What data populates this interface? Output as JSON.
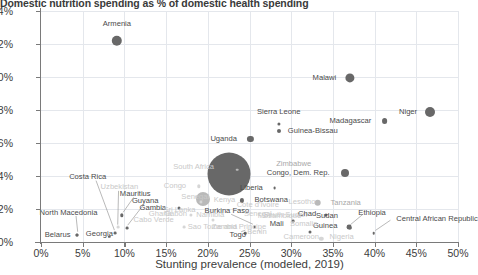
{
  "chart_data": {
    "type": "scatter",
    "title": "Domestic nutrition spending as % of domestic health spending",
    "xlabel": "Stunting prevalence (modeled, 2019)",
    "ylabel": "",
    "xlim": [
      0,
      50
    ],
    "ylim": [
      0,
      14
    ],
    "xticks": [
      "0%",
      "5%",
      "10%",
      "15%",
      "20%",
      "25%",
      "30%",
      "35%",
      "40%",
      "45%",
      "50%"
    ],
    "yticks": [
      "0%",
      "2%",
      "4%",
      "6%",
      "8%",
      "10%",
      "12%",
      "14%"
    ],
    "grid": true,
    "legend": "none",
    "size_encoding": "bubble area",
    "colors": {
      "bubble_dark": "#686868",
      "bubble_mid": "#b9b9b9",
      "bubble_faint": "#d6d6d6",
      "grid": "#e4e7ec",
      "axis": "#7a7a7a",
      "text": "#3c3c3c"
    },
    "points": [
      {
        "name": "Armenia",
        "x": 9.1,
        "y": 12.2,
        "r": 5.2,
        "tone": "dark",
        "lx": 9.1,
        "ly": 13.2,
        "anchor": "c"
      },
      {
        "name": "Malawi",
        "x": 37.0,
        "y": 9.95,
        "r": 4.6,
        "tone": "dark",
        "lx": 35.4,
        "ly": 9.95,
        "anchor": "r"
      },
      {
        "name": "Niger",
        "x": 46.7,
        "y": 7.85,
        "r": 5.0,
        "tone": "dark",
        "lx": 45.1,
        "ly": 7.85,
        "anchor": "r"
      },
      {
        "name": "Madagascar",
        "x": 41.2,
        "y": 7.35,
        "r": 2.9,
        "tone": "dark",
        "lx": 39.6,
        "ly": 7.35,
        "anchor": "r"
      },
      {
        "name": "Sierra Leone",
        "x": 28.5,
        "y": 7.15,
        "r": 1.6,
        "tone": "dark",
        "lx": 28.5,
        "ly": 7.9,
        "anchor": "c"
      },
      {
        "name": "Guinea-Bissau",
        "x": 28.5,
        "y": 6.72,
        "r": 2.0,
        "tone": "dark",
        "lx": 29.6,
        "ly": 6.72,
        "anchor": "l"
      },
      {
        "name": "Uganda",
        "x": 25.1,
        "y": 6.25,
        "r": 3.1,
        "tone": "dark",
        "lx": 23.5,
        "ly": 6.25,
        "anchor": "r"
      },
      {
        "name": "Zimbabwe",
        "x": 23.5,
        "y": 4.38,
        "r": 1.3,
        "tone": "mid",
        "lx": 28.2,
        "ly": 4.72,
        "anchor": "l"
      },
      {
        "name": "Congo, Dem. Rep.",
        "x": 36.4,
        "y": 4.18,
        "r": 4.0,
        "tone": "dark",
        "lx": 34.6,
        "ly": 4.18,
        "anchor": "r"
      },
      {
        "name": "South Africa",
        "x": 18.3,
        "y": 4.52,
        "r": 0.0,
        "tone": "faint",
        "lx": 18.3,
        "ly": 4.52,
        "anchor": "c"
      },
      {
        "name": "big-bubble",
        "x": 22.6,
        "y": 4.15,
        "r": 21.5,
        "tone": "dark",
        "lx": null,
        "ly": null,
        "anchor": "c"
      },
      {
        "name": "mid-bubble",
        "x": 19.4,
        "y": 2.62,
        "r": 7.0,
        "tone": "mid",
        "lx": null,
        "ly": null,
        "anchor": "c"
      },
      {
        "name": "Liberia",
        "x": 28.0,
        "y": 3.25,
        "r": 1.4,
        "tone": "dark",
        "lx": 26.6,
        "ly": 3.25,
        "anchor": "r"
      },
      {
        "name": "Costa Rica",
        "x": 8.9,
        "y": 0.52,
        "r": 1.4,
        "tone": "dark",
        "lx": 5.6,
        "ly": 3.95,
        "anchor": "c"
      },
      {
        "name": "Uzbekistan",
        "x": 9.2,
        "y": 0.9,
        "r": 1.4,
        "tone": "faint",
        "lx": 9.4,
        "ly": 3.32,
        "anchor": "c"
      },
      {
        "name": "Mauritius",
        "x": 9.7,
        "y": 1.62,
        "r": 1.7,
        "tone": "dark",
        "lx": 11.3,
        "ly": 2.92,
        "anchor": "c"
      },
      {
        "name": "Guyana",
        "x": 10.3,
        "y": 0.85,
        "r": 1.4,
        "tone": "dark",
        "lx": 12.5,
        "ly": 2.48,
        "anchor": "c"
      },
      {
        "name": "North Macedonia",
        "x": 4.3,
        "y": 0.42,
        "r": 1.5,
        "tone": "dark",
        "lx": 3.3,
        "ly": 1.78,
        "anchor": "c"
      },
      {
        "name": "Belarus",
        "x": 4.3,
        "y": 0.42,
        "r": 1.5,
        "tone": "dark",
        "lx": 2.0,
        "ly": 0.45,
        "anchor": "c"
      },
      {
        "name": "Georgia",
        "x": 8.2,
        "y": 0.3,
        "r": 1.2,
        "tone": "dark",
        "lx": 7.0,
        "ly": 0.48,
        "anchor": "c"
      },
      {
        "name": "Gambia",
        "x": 16.5,
        "y": 2.08,
        "r": 1.5,
        "tone": "dark",
        "lx": 15.0,
        "ly": 2.08,
        "anchor": "r"
      },
      {
        "name": "Burkina Faso",
        "x": 25.6,
        "y": 0.92,
        "r": 1.4,
        "tone": "dark",
        "lx": 22.3,
        "ly": 1.85,
        "anchor": "c"
      },
      {
        "name": "Togo",
        "x": 24.5,
        "y": 0.55,
        "r": 1.3,
        "tone": "dark",
        "lx": 23.6,
        "ly": 0.45,
        "anchor": "c"
      },
      {
        "name": "Botswana",
        "x": 24.1,
        "y": 2.52,
        "r": 2.1,
        "tone": "dark",
        "lx": 25.6,
        "ly": 2.52,
        "anchor": "l"
      },
      {
        "name": "Mali",
        "x": 30.2,
        "y": 1.28,
        "r": 1.4,
        "tone": "dark",
        "lx": 29.1,
        "ly": 1.12,
        "anchor": "r"
      },
      {
        "name": "South Sudan",
        "x": 31.0,
        "y": 1.4,
        "r": 0.0,
        "tone": "faint",
        "lx": 29.3,
        "ly": 1.62,
        "anchor": "c"
      },
      {
        "name": "Guinea",
        "x": 32.2,
        "y": 0.58,
        "r": 1.5,
        "tone": "dark",
        "lx": 32.6,
        "ly": 0.98,
        "anchor": "l"
      },
      {
        "name": "Chad",
        "x": 34.2,
        "y": 1.62,
        "r": 1.5,
        "tone": "dark",
        "lx": 33.0,
        "ly": 1.72,
        "anchor": "r"
      },
      {
        "name": "Tanzania",
        "x": 33.2,
        "y": 2.38,
        "r": 3.3,
        "tone": "mid",
        "lx": 34.7,
        "ly": 2.38,
        "anchor": "l"
      },
      {
        "name": "Sudan",
        "x": 36.9,
        "y": 0.92,
        "r": 2.4,
        "tone": "dark",
        "lx": 35.6,
        "ly": 1.58,
        "anchor": "r"
      },
      {
        "name": "Ethiopia",
        "x": 37.1,
        "y": 0.86,
        "r": 1.4,
        "tone": "dark",
        "lx": 39.7,
        "ly": 1.78,
        "anchor": "c"
      },
      {
        "name": "Central African Republic",
        "x": 39.9,
        "y": 0.52,
        "r": 1.3,
        "tone": "dark",
        "lx": 42.6,
        "ly": 1.42,
        "anchor": "l"
      },
      {
        "name": "Nigeria",
        "x": 33.6,
        "y": 0.18,
        "r": 2.2,
        "tone": "faint",
        "lx": 34.6,
        "ly": 0.32,
        "anchor": "l"
      },
      {
        "name": "Gabon",
        "x": 18.0,
        "y": 1.62,
        "r": 1.6,
        "tone": "faint",
        "lx": 17.5,
        "ly": 1.72,
        "anchor": "r"
      },
      {
        "name": "Namibia",
        "x": 20.6,
        "y": 1.35,
        "r": 1.5,
        "tone": "faint",
        "lx": 20.3,
        "ly": 1.62,
        "anchor": "c"
      },
      {
        "name": "Senegal",
        "x": 19.2,
        "y": 2.45,
        "r": 1.6,
        "tone": "faint",
        "lx": 18.5,
        "ly": 2.72,
        "anchor": "c"
      },
      {
        "name": "Congo",
        "x": 18.9,
        "y": 3.38,
        "r": 1.7,
        "tone": "faint",
        "lx": 17.4,
        "ly": 3.38,
        "anchor": "r"
      },
      {
        "name": "Sri Lanka",
        "x": 16.6,
        "y": 1.95,
        "r": 0.0,
        "tone": "faint",
        "lx": 16.6,
        "ly": 1.95,
        "anchor": "c"
      },
      {
        "name": "Sao Tome and Principe",
        "x": 17.2,
        "y": 0.92,
        "r": 1.4,
        "tone": "faint",
        "lx": 17.6,
        "ly": 0.92,
        "anchor": "l"
      },
      {
        "name": "Cabo Verde",
        "x": 13.5,
        "y": 1.32,
        "r": 0.0,
        "tone": "faint",
        "lx": 13.5,
        "ly": 1.32,
        "anchor": "c"
      },
      {
        "name": "Ghana",
        "x": 14.6,
        "y": 1.7,
        "r": 0.0,
        "tone": "faint",
        "lx": 14.3,
        "ly": 1.7,
        "anchor": "c"
      },
      {
        "name": "Kenya",
        "x": 22.0,
        "y": 2.55,
        "r": 0.0,
        "tone": "faint",
        "lx": 22.0,
        "ly": 2.55,
        "anchor": "c"
      },
      {
        "name": "Cote d'Ivoire",
        "x": 26.4,
        "y": 2.22,
        "r": 0.0,
        "tone": "faint",
        "lx": 26.0,
        "ly": 2.22,
        "anchor": "c"
      },
      {
        "name": "Senegal2",
        "x": 26.2,
        "y": 1.68,
        "r": 0.0,
        "tone": "faint",
        "lx": 26.0,
        "ly": 1.68,
        "anchor": "c"
      },
      {
        "name": "Cameroon",
        "x": 31.6,
        "y": 0.32,
        "r": 0.0,
        "tone": "faint",
        "lx": 31.2,
        "ly": 0.32,
        "anchor": "c"
      },
      {
        "name": "Zambia",
        "x": 22.0,
        "y": 0.92,
        "r": 0.0,
        "tone": "faint",
        "lx": 22.0,
        "ly": 0.92,
        "anchor": "c"
      },
      {
        "name": "Lesotho",
        "x": 31.9,
        "y": 2.45,
        "r": 0.0,
        "tone": "faint",
        "lx": 31.3,
        "ly": 2.45,
        "anchor": "c"
      },
      {
        "name": "Somalia",
        "x": 32.0,
        "y": 1.1,
        "r": 0.0,
        "tone": "faint",
        "lx": 31.5,
        "ly": 1.1,
        "anchor": "c"
      },
      {
        "name": "Mozambique",
        "x": 29.0,
        "y": 1.55,
        "r": 0.0,
        "tone": "faint",
        "lx": 28.6,
        "ly": 1.55,
        "anchor": "c"
      },
      {
        "name": "Benin",
        "x": 26.2,
        "y": 0.62,
        "r": 1.3,
        "tone": "faint",
        "lx": 25.9,
        "ly": 0.62,
        "anchor": "c"
      }
    ],
    "leader_lines": [
      {
        "from": [
          6.6,
          3.72
        ],
        "to": [
          8.8,
          0.72
        ]
      },
      {
        "from": [
          9.3,
          3.1
        ],
        "to": [
          9.2,
          1.05
        ]
      },
      {
        "from": [
          11.1,
          2.7
        ],
        "to": [
          9.85,
          1.8
        ]
      },
      {
        "from": [
          12.3,
          2.26
        ],
        "to": [
          10.4,
          1.02
        ]
      },
      {
        "from": [
          4.2,
          1.58
        ],
        "to": [
          4.4,
          0.62
        ]
      },
      {
        "from": [
          22.8,
          1.68
        ],
        "to": [
          25.4,
          1.08
        ]
      },
      {
        "from": [
          24.0,
          0.62
        ],
        "to": [
          24.5,
          0.72
        ]
      },
      {
        "from": [
          38.6,
          1.68
        ],
        "to": [
          37.1,
          1.05
        ]
      },
      {
        "from": [
          41.9,
          1.32
        ],
        "to": [
          40.1,
          0.7
        ]
      }
    ]
  }
}
